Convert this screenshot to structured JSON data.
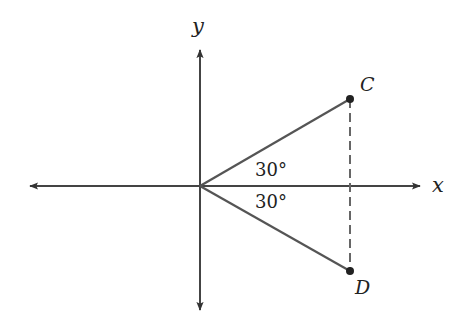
{
  "diagram": {
    "type": "coordinate-plane-angles",
    "axes": {
      "x_label": "x",
      "y_label": "y"
    },
    "points": {
      "C": {
        "label": "C"
      },
      "D": {
        "label": "D"
      }
    },
    "angles": {
      "upper": {
        "label": "30°",
        "degrees": 30
      },
      "lower": {
        "label": "30°",
        "degrees": 30
      }
    },
    "segments": [
      {
        "from": "origin",
        "to": "C",
        "style": "solid"
      },
      {
        "from": "origin",
        "to": "D",
        "style": "solid"
      },
      {
        "from": "C",
        "to": "D",
        "style": "dashed"
      }
    ],
    "colors": {
      "line": "#555555",
      "axis": "#444444",
      "point": "#222222",
      "text": "#222222"
    }
  }
}
